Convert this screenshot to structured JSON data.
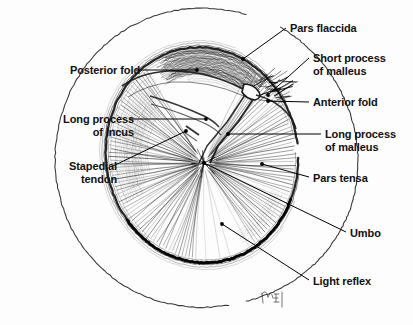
{
  "figure": {
    "background_color": "#fdfdfd",
    "ink_color": "#1a1a1a",
    "width": 413,
    "height": 325,
    "signature": "MF"
  },
  "labels": [
    {
      "id": "pars-flaccida",
      "text": "Pars flaccida",
      "side": "right",
      "x": 290,
      "y": 22,
      "leader": [
        [
          286,
          28
        ],
        [
          243,
          59
        ]
      ],
      "dot": [
        243,
        59
      ]
    },
    {
      "id": "short-process-of-malleus",
      "text": "Short process\nof malleus",
      "side": "right",
      "x": 313,
      "y": 52,
      "leader": [
        [
          309,
          58
        ],
        [
          268,
          95
        ]
      ],
      "dot": [
        268,
        95
      ]
    },
    {
      "id": "anterior-fold",
      "text": "Anterior fold",
      "side": "right",
      "x": 313,
      "y": 96,
      "leader": [
        [
          309,
          102
        ],
        [
          268,
          101
        ]
      ],
      "dot": [
        268,
        101
      ]
    },
    {
      "id": "long-process-of-malleus",
      "text": "Long process\nof malleus",
      "side": "right",
      "x": 325,
      "y": 128,
      "leader": [
        [
          321,
          134
        ],
        [
          228,
          134
        ]
      ],
      "dot": [
        228,
        134
      ]
    },
    {
      "id": "pars-tensa",
      "text": "Pars tensa",
      "side": "right",
      "x": 313,
      "y": 172,
      "leader": [
        [
          309,
          177
        ],
        [
          262,
          164
        ]
      ],
      "dot": [
        262,
        164
      ]
    },
    {
      "id": "umbo",
      "text": "Umbo",
      "side": "right",
      "x": 350,
      "y": 227,
      "leader": [
        [
          346,
          232
        ],
        [
          204,
          163
        ]
      ],
      "dot": [
        204,
        163
      ]
    },
    {
      "id": "light-reflex",
      "text": "Light reflex",
      "side": "right",
      "x": 313,
      "y": 275,
      "leader": [
        [
          309,
          280
        ],
        [
          222,
          224
        ]
      ],
      "dot": [
        222,
        224
      ]
    },
    {
      "id": "posterior-fold",
      "text": "Posterior fold",
      "side": "left",
      "x": 53,
      "y": 64,
      "leader": [
        [
          136,
          70
        ],
        [
          197,
          70
        ]
      ],
      "dot": [
        197,
        70
      ]
    },
    {
      "id": "long-process-of-incus",
      "text": "Long process\nof incus",
      "side": "left",
      "x": 22,
      "y": 113,
      "leader": [
        [
          130,
          119
        ],
        [
          206,
          119
        ]
      ],
      "dot": [
        206,
        119
      ]
    },
    {
      "id": "stapedial-tendon",
      "text": "Stapedial\ntendon",
      "side": "left",
      "x": 37,
      "y": 160,
      "leader": [
        [
          113,
          166
        ],
        [
          186,
          131
        ]
      ],
      "dot": [
        186,
        131
      ]
    }
  ],
  "anatomy": {
    "ear_canal_circle": {
      "cx": 206,
      "cy": 158,
      "r": 152
    },
    "drum_ellipse": {
      "cx": 202,
      "cy": 155,
      "rx": 96,
      "ry": 108,
      "rotation": -8
    },
    "umbo_point": {
      "x": 204,
      "y": 163
    },
    "short_process_point": {
      "x": 252,
      "y": 92
    },
    "malleus_handle": [
      [
        252,
        92
      ],
      [
        232,
        122
      ],
      [
        212,
        146
      ],
      [
        204,
        163
      ]
    ],
    "light_reflex_wedge": {
      "from": [
        204,
        163
      ],
      "spread_deg": 17,
      "axis_deg": 76,
      "length": 96
    },
    "pars_tensa_radial_fibers": 168,
    "pars_flaccida_region": {
      "top": 42,
      "bottom": 96
    }
  }
}
